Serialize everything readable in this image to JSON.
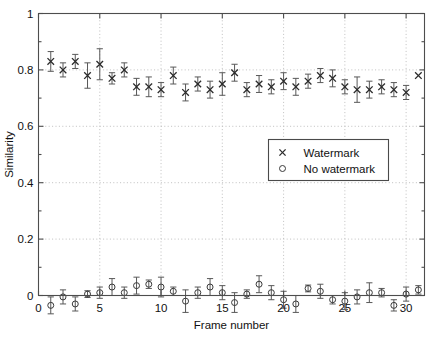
{
  "chart_data": {
    "type": "scatter",
    "title": "",
    "xlabel": "Frame number",
    "ylabel": "Similarity",
    "xlim": [
      0,
      31.5
    ],
    "ylim": [
      0,
      1
    ],
    "xticks": [
      0,
      5,
      10,
      15,
      20,
      25,
      30
    ],
    "xticklabels": [
      "0",
      "5",
      "10",
      "15",
      "20",
      "25",
      "30"
    ],
    "yticks": [
      0,
      0.2,
      0.4,
      0.6,
      0.8,
      1
    ],
    "yticklabels": [
      "0",
      "0.2",
      "0.4",
      "0.6",
      "0.8",
      "1"
    ],
    "grid": true,
    "grid_style": "dotted",
    "legend_position": "center-right",
    "x": [
      1,
      2,
      3,
      4,
      5,
      6,
      7,
      8,
      9,
      10,
      11,
      12,
      13,
      14,
      15,
      16,
      17,
      18,
      19,
      20,
      21,
      22,
      23,
      24,
      25,
      26,
      27,
      28,
      29,
      30,
      31
    ],
    "series": [
      {
        "name": "Watermark",
        "marker": "x",
        "values": [
          0.83,
          0.8,
          0.83,
          0.78,
          0.82,
          0.77,
          0.8,
          0.74,
          0.74,
          0.73,
          0.78,
          0.72,
          0.75,
          0.73,
          0.75,
          0.79,
          0.73,
          0.75,
          0.74,
          0.76,
          0.74,
          0.76,
          0.78,
          0.77,
          0.74,
          0.73,
          0.73,
          0.74,
          0.73,
          0.72,
          0.78
        ],
        "errors": [
          0.035,
          0.025,
          0.025,
          0.045,
          0.055,
          0.02,
          0.025,
          0.03,
          0.035,
          0.025,
          0.03,
          0.03,
          0.025,
          0.03,
          0.04,
          0.03,
          0.025,
          0.03,
          0.025,
          0.03,
          0.03,
          0.025,
          0.025,
          0.03,
          0.025,
          0.045,
          0.03,
          0.025,
          0.025,
          0.025,
          0.0
        ]
      },
      {
        "name": "No watermark",
        "marker": "o",
        "values": [
          -0.035,
          -0.005,
          -0.03,
          0.005,
          0.01,
          0.03,
          0.01,
          0.035,
          0.04,
          0.03,
          0.015,
          -0.02,
          0.01,
          0.03,
          0.01,
          -0.025,
          0.005,
          0.04,
          0.01,
          -0.015,
          -0.03,
          0.025,
          0.015,
          -0.015,
          -0.02,
          -0.005,
          0.01,
          0.01,
          -0.035,
          0.005,
          0.02
        ],
        "errors": [
          0.03,
          0.025,
          0.025,
          0.012,
          0.02,
          0.03,
          0.02,
          0.03,
          0.015,
          0.035,
          0.015,
          0.04,
          0.02,
          0.03,
          0.025,
          0.035,
          0.015,
          0.03,
          0.025,
          0.03,
          0.03,
          0.012,
          0.025,
          0.015,
          0.03,
          0.025,
          0.035,
          0.015,
          0.02,
          0.025,
          0.015
        ]
      }
    ]
  },
  "legend": {
    "entries": [
      {
        "label": "Watermark",
        "marker": "x"
      },
      {
        "label": "No watermark",
        "marker": "o"
      }
    ]
  },
  "colors": {
    "axis": "#4d4d4d",
    "grid": "#b9b9b9",
    "marker": "#2b2b2b",
    "errorbar": "#585858",
    "background": "#ffffff"
  }
}
